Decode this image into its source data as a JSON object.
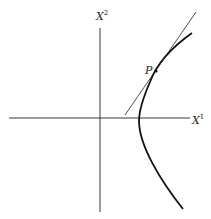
{
  "diagram": {
    "axes": {
      "x_label": "X",
      "x_superscript": "1",
      "y_label": "X",
      "y_superscript": "2"
    },
    "curve": "hyperbola (right branch)",
    "point_label": "P",
    "tangent_line": "tangent at P",
    "colors": {
      "stroke": "#1a1a1a",
      "background": "#ffffff"
    }
  }
}
